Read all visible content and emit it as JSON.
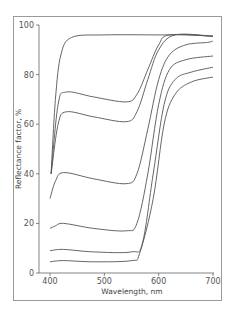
{
  "chart_data": {
    "type": "line",
    "title": "",
    "xlabel": "Wavelength, nm",
    "ylabel": "Reflectance factor, %",
    "xlim": [
      400,
      700
    ],
    "ylim": [
      0,
      100
    ],
    "xticks": [
      400,
      500,
      600,
      700
    ],
    "yticks": [
      0,
      20,
      40,
      60,
      80,
      100
    ],
    "grid": false,
    "legend": null,
    "line_color": "#555555",
    "series": [
      {
        "name": "curve-1",
        "x": [
          402,
          410,
          420,
          440,
          500,
          600,
          650,
          700
        ],
        "y": [
          40,
          70,
          88,
          95,
          96,
          96,
          96,
          95.5
        ]
      },
      {
        "name": "curve-2",
        "x": [
          402,
          415,
          430,
          480,
          540,
          560,
          580,
          600,
          620,
          700
        ],
        "y": [
          40,
          68,
          73,
          71,
          69,
          72,
          82,
          92,
          96,
          95.5
        ]
      },
      {
        "name": "curve-3",
        "x": [
          402,
          415,
          430,
          480,
          540,
          560,
          580,
          600,
          630,
          700
        ],
        "y": [
          40,
          60,
          65,
          63,
          61,
          65,
          78,
          90,
          96,
          95.5
        ]
      },
      {
        "name": "curve-4",
        "x": [
          400,
          410,
          425,
          480,
          540,
          560,
          580,
          600,
          620,
          650,
          690,
          700
        ],
        "y": [
          30,
          37,
          40.5,
          38,
          36,
          40,
          58,
          78,
          88,
          92,
          93,
          93.5
        ]
      },
      {
        "name": "curve-5",
        "x": [
          400,
          410,
          425,
          480,
          540,
          560,
          580,
          600,
          620,
          650,
          700
        ],
        "y": [
          18,
          19,
          20,
          18,
          17,
          20,
          40,
          68,
          82,
          86,
          87.5
        ]
      },
      {
        "name": "curve-6",
        "x": [
          400,
          425,
          480,
          550,
          570,
          590,
          610,
          630,
          660,
          700
        ],
        "y": [
          9,
          9.5,
          8.5,
          8.5,
          12,
          40,
          68,
          78,
          81,
          83
        ]
      },
      {
        "name": "curve-7",
        "x": [
          400,
          425,
          480,
          550,
          565,
          590,
          610,
          630,
          660,
          700
        ],
        "y": [
          4.5,
          5,
          4.5,
          5,
          8,
          30,
          60,
          72,
          77,
          79
        ]
      }
    ]
  },
  "labels": {
    "xlabel": "Wavelength, nm",
    "ylabel": "Reflectance factor, %",
    "xticks": [
      "400",
      "500",
      "600",
      "700"
    ],
    "yticks": [
      "0",
      "20",
      "40",
      "60",
      "80",
      "100"
    ]
  }
}
